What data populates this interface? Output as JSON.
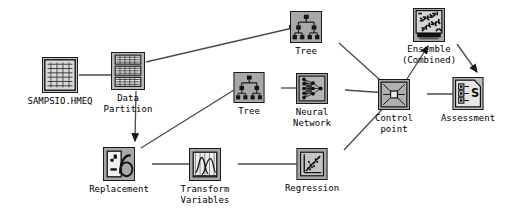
{
  "diagram": {
    "background_color": "#ffffff",
    "node_fill_color": "#a8a8a8",
    "node_inner_color": "#c9c9c9",
    "node_border_color": "#1a1a1a",
    "edge_color": "#4a4a4a",
    "label_color": "#000000"
  },
  "nodes": [
    {
      "id": "sampsio-hmeq",
      "label": "SAMPSIO.HMEQ",
      "icon": "data-table-icon",
      "x": 60,
      "y": 57,
      "w": 36,
      "h": 36,
      "label_y": 96
    },
    {
      "id": "data-partition",
      "label": "Data\nPartition",
      "icon": "data-partition-icon",
      "x": 128,
      "y": 52,
      "w": 34,
      "h": 38,
      "label_y": 93
    },
    {
      "id": "replacement",
      "label": "Replacement",
      "icon": "replacement-icon",
      "x": 119,
      "y": 147,
      "w": 32,
      "h": 34,
      "label_y": 184
    },
    {
      "id": "transform-variables",
      "label": "Transform\nVariables",
      "icon": "transform-variables-icon",
      "x": 205,
      "y": 148,
      "w": 32,
      "h": 33,
      "label_y": 184
    },
    {
      "id": "tree-middle",
      "label": "Tree",
      "icon": "tree-icon",
      "x": 249,
      "y": 72,
      "w": 31,
      "h": 31,
      "label_y": 106
    },
    {
      "id": "tree-top",
      "label": "Tree",
      "icon": "tree-icon",
      "x": 306,
      "y": 11,
      "w": 32,
      "h": 32,
      "label_y": 46
    },
    {
      "id": "neural-network",
      "label": "Neural\nNetwork",
      "icon": "neural-network-icon",
      "x": 312,
      "y": 73,
      "w": 32,
      "h": 31,
      "label_y": 107
    },
    {
      "id": "regression",
      "label": "Regression",
      "icon": "regression-icon",
      "x": 312,
      "y": 148,
      "w": 31,
      "h": 32,
      "label_y": 183
    },
    {
      "id": "control-point",
      "label": "Control\npoint",
      "icon": "control-point-icon",
      "x": 394,
      "y": 79,
      "w": 32,
      "h": 31,
      "label_y": 113
    },
    {
      "id": "ensemble-combined",
      "label": "Ensemble\n(Combined)",
      "icon": "ensemble-icon",
      "x": 429,
      "y": 8,
      "w": 32,
      "h": 34,
      "label_y": 44
    },
    {
      "id": "assessment",
      "label": "Assessment",
      "icon": "assessment-icon",
      "x": 468,
      "y": 77,
      "w": 31,
      "h": 33,
      "label_y": 113
    }
  ],
  "edges": [
    {
      "id": "e1",
      "from": "sampsio-hmeq",
      "to": "data-partition",
      "d": "M 79 75 L 122 75"
    },
    {
      "id": "e2",
      "from": "data-partition",
      "to": "tree-top",
      "d": "M 146 62 L 297 27"
    },
    {
      "id": "e3",
      "from": "data-partition",
      "to": "replacement",
      "d": "M 136 91 L 135 141"
    },
    {
      "id": "e4",
      "from": "replacement",
      "to": "tree-middle",
      "d": "M 141 148 L 242 85"
    },
    {
      "id": "e5",
      "from": "replacement",
      "to": "transform-variables",
      "d": "M 152 164 L 199 164"
    },
    {
      "id": "e6",
      "from": "tree-middle",
      "to": "neural-network",
      "d": "M 281 88 L 306 88"
    },
    {
      "id": "e7",
      "from": "transform-variables",
      "to": "regression",
      "d": "M 238 164 L 306 164"
    },
    {
      "id": "e8",
      "from": "tree-top",
      "to": "control-point",
      "d": "M 339 43 L 389 88"
    },
    {
      "id": "e9",
      "from": "neural-network",
      "to": "control-point",
      "d": "M 345 90 L 388 93"
    },
    {
      "id": "e10",
      "from": "regression",
      "to": "control-point",
      "d": "M 344 150 L 389 102"
    },
    {
      "id": "e11",
      "from": "control-point",
      "to": "ensemble-combined",
      "d": "M 407 79 L 428 46"
    },
    {
      "id": "e12",
      "from": "control-point",
      "to": "assessment",
      "d": "M 427 94 L 462 94"
    },
    {
      "id": "e13",
      "from": "ensemble-combined",
      "to": "assessment",
      "d": "M 457 44 L 477 72"
    }
  ]
}
